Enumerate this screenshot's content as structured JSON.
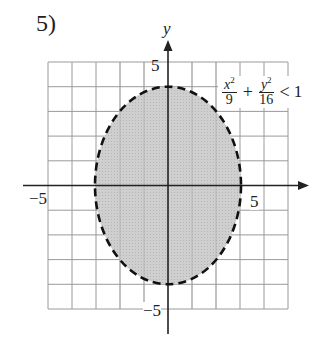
{
  "problem": {
    "number": "5)"
  },
  "graph": {
    "y_axis_label": "y",
    "tick_labels": {
      "y_top": "5",
      "y_bottom": "−5",
      "x_left": "−5",
      "x_right": "5"
    },
    "grid": {
      "x_min": -5,
      "x_max": 5,
      "y_min": -5,
      "y_max": 5,
      "step": 1
    },
    "ellipse": {
      "center": [
        0,
        0
      ],
      "semi_x": 3,
      "semi_y": 4,
      "boundary": "dashed",
      "fill": "#c8c8c8",
      "shaded": "inside"
    }
  },
  "inequality": {
    "term1_num": "x",
    "term1_exp": "2",
    "term1_den": "9",
    "plus": "+",
    "term2_num": "y",
    "term2_exp": "2",
    "term2_den": "16",
    "relation": "<",
    "rhs": "1",
    "text": "x^2/9 + y^2/16 < 1"
  }
}
